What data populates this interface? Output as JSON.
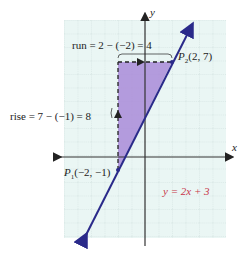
{
  "diagram": {
    "axes": {
      "x_label": "x",
      "y_label": "y"
    },
    "line": {
      "equation": "y = 2x + 3",
      "color": "#2a2a8a"
    },
    "points": [
      {
        "name": "P",
        "sub": "1",
        "coords": "(−2, −1)",
        "x": -2,
        "y": -1
      },
      {
        "name": "P",
        "sub": "2",
        "coords": "(2, 7)",
        "x": 2,
        "y": 7
      }
    ],
    "run_label": "run = 2 − (−2) = 4",
    "rise_label": "rise = 7 − (−1) = 8",
    "colors": {
      "grid_bg": "#eaf6f4",
      "grid_line": "#b9cfcc",
      "triangle": "#a98bd8",
      "equation": "#c8374a"
    }
  }
}
